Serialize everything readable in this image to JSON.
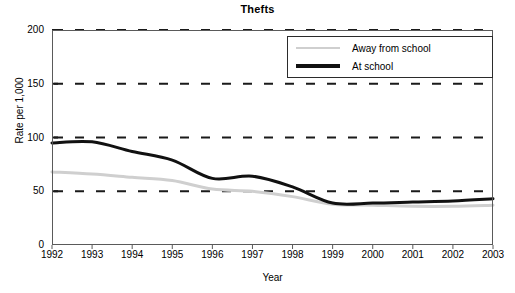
{
  "chart_data": {
    "type": "line",
    "title": "Thefts",
    "xlabel": "Year",
    "ylabel": "Rate per 1,000",
    "x": [
      1992,
      1993,
      1994,
      1995,
      1996,
      1997,
      1998,
      1999,
      2000,
      2001,
      2002,
      2003
    ],
    "categories": [
      "1992",
      "1993",
      "1994",
      "1995",
      "1996",
      "1997",
      "1998",
      "1999",
      "2000",
      "2001",
      "2002",
      "2003"
    ],
    "xlim": [
      1992,
      2003
    ],
    "ylim": [
      0,
      200
    ],
    "yticks": [
      0,
      50,
      100,
      150,
      200
    ],
    "ytick_labels": [
      "0",
      "50",
      "100",
      "150",
      "200"
    ],
    "grid": "horizontal-dashed",
    "legend_position": "top-right",
    "series": [
      {
        "name": "Away from school",
        "color": "#cfcfcf",
        "width": 3,
        "values": [
          68,
          66,
          63,
          60,
          52,
          50,
          45,
          38,
          37,
          36,
          36,
          37
        ]
      },
      {
        "name": "At school",
        "color": "#111111",
        "width": 3,
        "values": [
          95,
          96,
          87,
          79,
          62,
          64,
          54,
          39,
          39,
          40,
          41,
          43
        ]
      }
    ]
  },
  "legend": {
    "items": [
      {
        "label": "Away from school"
      },
      {
        "label": "At school"
      }
    ]
  }
}
